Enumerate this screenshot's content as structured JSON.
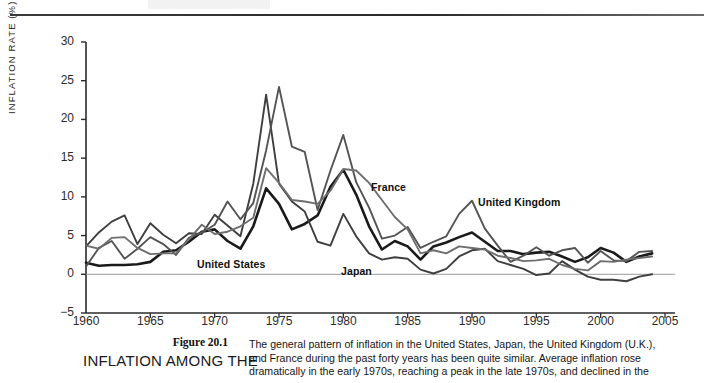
{
  "figure": {
    "number": "Figure 20.1",
    "title": "INFLATION AMONG THE",
    "caption_lines": [
      "The general pattern of inflation in the United States, Japan, the United Kingdom (U.K.),",
      "and France during the past forty years has been quite similar. Average inflation rose",
      "dramatically in the early 1970s, reaching a peak in the late 1970s, and declined in the"
    ]
  },
  "chart_data": {
    "type": "line",
    "title": "",
    "xlabel": "",
    "ylabel": "INFLATION RATE (%)",
    "xlim": [
      1960,
      2005
    ],
    "ylim": [
      -5,
      30
    ],
    "xticks": [
      1960,
      1965,
      1970,
      1975,
      1980,
      1985,
      1990,
      1995,
      2000,
      2005
    ],
    "yticks": [
      -5,
      0,
      5,
      10,
      15,
      20,
      25,
      30
    ],
    "grid": false,
    "legend_position": "inline-annotations",
    "zero_line": 0,
    "x": [
      1960,
      1961,
      1962,
      1963,
      1964,
      1965,
      1966,
      1967,
      1968,
      1969,
      1970,
      1971,
      1972,
      1973,
      1974,
      1975,
      1976,
      1977,
      1978,
      1979,
      1980,
      1981,
      1982,
      1983,
      1984,
      1985,
      1986,
      1987,
      1988,
      1989,
      1990,
      1991,
      1992,
      1993,
      1994,
      1995,
      1996,
      1997,
      1998,
      1999,
      2000,
      2001,
      2002,
      2003,
      2004
    ],
    "series": [
      {
        "name": "United States",
        "color": "#1a1a1a",
        "width": 2.6,
        "values": [
          1.5,
          1.1,
          1.2,
          1.2,
          1.3,
          1.6,
          2.9,
          3.1,
          4.2,
          5.5,
          5.8,
          4.3,
          3.3,
          6.2,
          11.1,
          9.1,
          5.8,
          6.5,
          7.6,
          11.3,
          13.5,
          10.3,
          6.2,
          3.2,
          4.3,
          3.6,
          1.9,
          3.6,
          4.1,
          4.8,
          5.4,
          4.2,
          3.0,
          3.0,
          2.6,
          2.8,
          2.9,
          2.3,
          1.6,
          2.2,
          3.4,
          2.8,
          1.6,
          2.3,
          2.7
        ]
      },
      {
        "name": "Japan",
        "color": "#3f3f3f",
        "width": 1.9,
        "values": [
          3.6,
          5.4,
          6.8,
          7.6,
          3.9,
          6.6,
          5.1,
          4.0,
          5.3,
          5.2,
          7.7,
          6.3,
          4.9,
          11.7,
          23.2,
          11.7,
          9.4,
          8.1,
          4.2,
          3.7,
          7.8,
          4.9,
          2.7,
          1.9,
          2.2,
          2.0,
          0.6,
          0.1,
          0.7,
          2.3,
          3.1,
          3.3,
          1.7,
          1.2,
          0.7,
          -0.1,
          0.1,
          1.7,
          0.6,
          -0.3,
          -0.7,
          -0.7,
          -0.9,
          -0.3,
          0.0
        ]
      },
      {
        "name": "United Kingdom",
        "color": "#545454",
        "width": 1.9,
        "values": [
          1.0,
          3.4,
          4.3,
          2.0,
          3.3,
          4.8,
          3.9,
          2.5,
          4.7,
          5.4,
          6.4,
          9.4,
          7.1,
          9.2,
          16.0,
          24.2,
          16.5,
          15.8,
          8.3,
          13.4,
          18.0,
          11.9,
          8.6,
          4.6,
          5.0,
          6.1,
          3.4,
          4.2,
          4.9,
          7.8,
          9.5,
          5.9,
          3.7,
          1.6,
          2.4,
          3.5,
          2.4,
          3.1,
          3.4,
          1.5,
          3.0,
          1.8,
          1.7,
          2.9,
          3.0
        ]
      },
      {
        "name": "France",
        "color": "#6e6e6e",
        "width": 1.9,
        "values": [
          3.7,
          3.3,
          4.7,
          4.8,
          3.4,
          2.6,
          2.7,
          2.7,
          4.5,
          6.4,
          5.2,
          5.5,
          6.2,
          7.3,
          13.7,
          11.8,
          9.6,
          9.4,
          9.1,
          10.8,
          13.6,
          13.4,
          11.8,
          9.6,
          7.4,
          5.8,
          2.7,
          3.1,
          2.7,
          3.6,
          3.4,
          3.2,
          2.4,
          2.1,
          1.7,
          1.8,
          2.0,
          1.2,
          0.7,
          0.5,
          1.7,
          1.6,
          1.9,
          2.1,
          2.3
        ]
      }
    ],
    "annotations": [
      {
        "text": "United States",
        "x_px": 197,
        "y_px": 258
      },
      {
        "text": "Japan",
        "x_px": 341,
        "y_px": 265
      },
      {
        "text": "France",
        "x_px": 371,
        "y_px": 181
      },
      {
        "text": "United Kingdom",
        "x_px": 478,
        "y_px": 196
      }
    ]
  }
}
